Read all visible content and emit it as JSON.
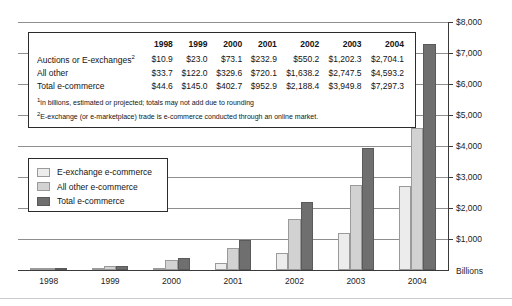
{
  "chart_data": {
    "type": "bar",
    "title": "",
    "xlabel": "",
    "ylabel": "Billions",
    "categories": [
      "1998",
      "1999",
      "2000",
      "2001",
      "2002",
      "2003",
      "2004"
    ],
    "ylim": [
      0,
      8000
    ],
    "yticks": [
      1000,
      2000,
      3000,
      4000,
      5000,
      6000,
      7000,
      8000
    ],
    "ytick_labels": [
      "$1,000",
      "$2,000",
      "$3,000",
      "$4,000",
      "$5,000",
      "$6,000",
      "$7,000",
      "$8,000"
    ],
    "grid": true,
    "legend_position": "inside-left",
    "series": [
      {
        "name": "E-exchange e-commerce",
        "color": "#ececec",
        "values": [
          10.9,
          23.0,
          73.1,
          232.9,
          550.2,
          1202.3,
          2704.1
        ]
      },
      {
        "name": "All other e-commerce",
        "color": "#d2d2d2",
        "values": [
          33.7,
          122.0,
          329.6,
          720.1,
          1638.2,
          2747.5,
          4593.2
        ]
      },
      {
        "name": "Total e-commerce",
        "color": "#6f6f6f",
        "values": [
          44.6,
          145.0,
          402.7,
          952.9,
          2188.4,
          3949.8,
          7297.3
        ]
      }
    ]
  },
  "table": {
    "corner_label": "",
    "columns": [
      "1998",
      "1999",
      "2000",
      "2001",
      "2002",
      "2003",
      "2004"
    ],
    "rows": [
      {
        "label": "Auctions or E-exchanges",
        "label_superscript": "2",
        "values": [
          "$10.9",
          "$23.0",
          "$73.1",
          "$232.9",
          "$550.2",
          "$1,202.3",
          "$2,704.1"
        ]
      },
      {
        "label": "All other",
        "label_superscript": "",
        "values": [
          "$33.7",
          "$122.0",
          "$329.6",
          "$720.1",
          "$1,638.2",
          "$2,747.5",
          "$4,593.2"
        ]
      },
      {
        "label": "Total e-commerce",
        "label_superscript": "",
        "values": [
          "$44.6",
          "$145.0",
          "$402.7",
          "$952.9",
          "$2,188.4",
          "$3,949.8",
          "$7,297.3"
        ]
      }
    ],
    "footnotes": [
      {
        "marker": "1",
        "text": "in billions, estimated or projected; totals may not add due to rounding"
      },
      {
        "marker": "2",
        "text": "E-exchange (or e-marketplace) trade is e-commerce conducted through an online market."
      }
    ]
  },
  "legend": {
    "items": [
      {
        "label": "E-exchange e-commerce",
        "color": "#ececec"
      },
      {
        "label": "All other e-commerce",
        "color": "#d2d2d2"
      },
      {
        "label": "Total e-commerce",
        "color": "#6f6f6f"
      }
    ]
  },
  "axis": {
    "unit_label": "Billions"
  }
}
